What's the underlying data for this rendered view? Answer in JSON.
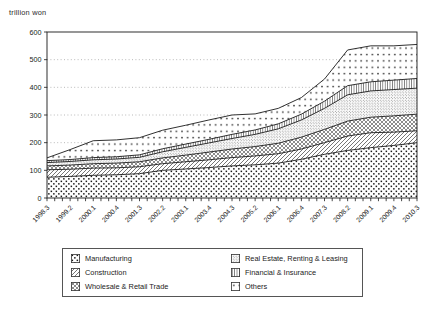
{
  "header": {
    "unit_label": "trillion won"
  },
  "colors": {
    "ink": "#1a1a1a",
    "grid": "#9c9c9c",
    "background": "#ffffff",
    "text": "#222222"
  },
  "chart_data": {
    "type": "area",
    "stacked": true,
    "title": "",
    "ylabel": "trillion won",
    "xlabel": "",
    "ylim": [
      0,
      600
    ],
    "ytick_step": 100,
    "yticks": [
      0,
      100,
      200,
      300,
      400,
      500,
      600
    ],
    "grid": "horizontal-dotted",
    "legend_position": "bottom-boxed-two-columns",
    "x_total_points": 49,
    "x_label_every_n_ticks": 3,
    "x_labels": [
      "1998.3",
      "1999.2",
      "2000.1",
      "2000.4",
      "2001.3",
      "2002.2",
      "2003.1",
      "2003.4",
      "2004.3",
      "2005.2",
      "2006.1",
      "2006.4",
      "2007.3",
      "2008.2",
      "2009.1",
      "2009.4",
      "2010.3"
    ],
    "series": [
      {
        "name": "Manufacturing",
        "pattern": "dots-medium",
        "values": [
          75,
          78,
          82,
          84,
          88,
          100,
          105,
          110,
          116,
          120,
          126,
          140,
          158,
          172,
          182,
          190,
          200
        ]
      },
      {
        "name": "Construction",
        "pattern": "diagonal-hatch",
        "values": [
          27,
          26,
          26,
          25,
          25,
          24,
          26,
          28,
          30,
          32,
          34,
          37,
          42,
          52,
          54,
          48,
          43
        ]
      },
      {
        "name": "Wholesale & Retail Trade",
        "pattern": "crosshatch",
        "values": [
          14,
          15,
          16,
          17,
          18,
          21,
          24,
          28,
          31,
          34,
          38,
          43,
          48,
          54,
          56,
          59,
          60
        ]
      },
      {
        "name": "Real Estate, Renting & Leasing",
        "pattern": "fine-stipple",
        "values": [
          12,
          13,
          14,
          15,
          16,
          22,
          28,
          33,
          38,
          44,
          52,
          62,
          76,
          95,
          95,
          95,
          94
        ]
      },
      {
        "name": "Financial & Insurance",
        "pattern": "vertical-lines",
        "values": [
          7,
          7,
          8,
          8,
          9,
          11,
          12,
          13,
          15,
          16,
          18,
          21,
          26,
          33,
          33,
          34,
          35
        ]
      },
      {
        "name": "Others",
        "pattern": "sparse-dots",
        "values": [
          10,
          36,
          61,
          61,
          62,
          67,
          68,
          70,
          70,
          58,
          56,
          60,
          80,
          129,
          130,
          124,
          123
        ]
      }
    ],
    "totals_approx": [
      145,
      175,
      207,
      210,
      218,
      245,
      263,
      282,
      300,
      304,
      324,
      363,
      430,
      535,
      550,
      550,
      555
    ]
  }
}
